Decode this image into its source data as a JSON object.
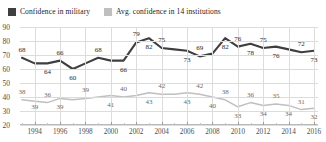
{
  "legend": {
    "position": "top-left",
    "entries": [
      {
        "label": "Confidence in military",
        "color": "#3f3f3f",
        "icon": "square-swatch-icon"
      },
      {
        "label": "Avg. confidence in 14 institutions",
        "color": "#bfbfbf",
        "icon": "square-swatch-icon"
      }
    ]
  },
  "axes": {
    "y_ticks": [
      90,
      80,
      70,
      60,
      50,
      40,
      30,
      20
    ],
    "x_ticks": [
      "1994",
      "1996",
      "1998",
      "2000",
      "2002",
      "2004",
      "2006",
      "2008",
      "2010",
      "2012",
      "2014",
      "2016"
    ]
  },
  "chart_data": {
    "type": "line",
    "title": "",
    "subtitle": "",
    "xlabel": "",
    "ylabel": "",
    "ylim": [
      20,
      90
    ],
    "xlim": [
      1993,
      2016
    ],
    "grid": true,
    "legend_position": "top-left",
    "x": [
      1993,
      1994,
      1995,
      1996,
      1997,
      1998,
      1999,
      2000,
      2001,
      2002,
      2003,
      2004,
      2005,
      2006,
      2007,
      2008,
      2009,
      2010,
      2011,
      2012,
      2013,
      2014,
      2015,
      2016
    ],
    "series": [
      {
        "name": "Confidence in military",
        "color": "#3f3f3f",
        "values": [
          68,
          64,
          64,
          66,
          60,
          64,
          68,
          66,
          66,
          79,
          82,
          75,
          74,
          73,
          69,
          71,
          82,
          76,
          78,
          75,
          76,
          74,
          72,
          73
        ],
        "labels": [
          {
            "x": 1993,
            "value": 68
          },
          {
            "x": 1995,
            "value": 64
          },
          {
            "x": 1996,
            "value": 66
          },
          {
            "x": 1997,
            "value": 60
          },
          {
            "x": 1999,
            "value": 68
          },
          {
            "x": 2001,
            "value": 66
          },
          {
            "x": 2002,
            "value": 79
          },
          {
            "x": 2003,
            "value": 82
          },
          {
            "x": 2004,
            "value": 75
          },
          {
            "x": 2006,
            "value": 73
          },
          {
            "x": 2007,
            "value": 69
          },
          {
            "x": 2009,
            "value": 82
          },
          {
            "x": 2010,
            "value": 76
          },
          {
            "x": 2011,
            "value": 78
          },
          {
            "x": 2012,
            "value": 75
          },
          {
            "x": 2013,
            "value": 76
          },
          {
            "x": 2015,
            "value": 72
          },
          {
            "x": 2016,
            "value": 73
          }
        ]
      },
      {
        "name": "Avg. confidence in 14 institutions",
        "color": "#bfbfbf",
        "values": [
          38,
          37,
          36,
          39,
          38,
          39,
          40,
          41,
          40,
          41,
          43,
          42,
          42,
          43,
          42,
          40,
          38,
          33,
          36,
          34,
          35,
          34,
          31,
          32
        ],
        "labels": [
          {
            "x": 1993,
            "value": 38
          },
          {
            "x": 1994,
            "value": 39
          },
          {
            "x": 1995,
            "value": 36
          },
          {
            "x": 1996,
            "value": 39
          },
          {
            "x": 1998,
            "value": 39
          },
          {
            "x": 2000,
            "value": 41
          },
          {
            "x": 2001,
            "value": 40
          },
          {
            "x": 2003,
            "value": 43
          },
          {
            "x": 2004,
            "value": 42
          },
          {
            "x": 2006,
            "value": 43
          },
          {
            "x": 2007,
            "value": 42
          },
          {
            "x": 2008,
            "value": 40
          },
          {
            "x": 2009,
            "value": 38
          },
          {
            "x": 2010,
            "value": 33
          },
          {
            "x": 2011,
            "value": 36
          },
          {
            "x": 2012,
            "value": 34
          },
          {
            "x": 2013,
            "value": 35
          },
          {
            "x": 2014,
            "value": 34
          },
          {
            "x": 2015,
            "value": 31
          },
          {
            "x": 2016,
            "value": 32
          }
        ]
      }
    ]
  }
}
